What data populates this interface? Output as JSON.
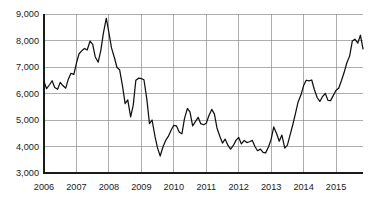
{
  "chart_data": {
    "type": "line",
    "title": "",
    "subtitle": "",
    "xlabel": "",
    "ylabel": "",
    "grid": true,
    "legend": false,
    "legend_position": "none",
    "line_color": "#111111",
    "grid_color": "#8c8c8c",
    "axis_color": "#1a1a1a",
    "background_color": "#ffffff",
    "xlim": [
      2006,
      2015.83
    ],
    "ylim": [
      3000,
      9000
    ],
    "y_ticks": [
      3000,
      4000,
      5000,
      6000,
      7000,
      8000,
      9000
    ],
    "y_tick_labels": [
      "3,000",
      "4,000",
      "5,000",
      "6,000",
      "7,000",
      "8,000",
      "9,000"
    ],
    "x_ticks": [
      2006,
      2007,
      2008,
      2009,
      2010,
      2011,
      2012,
      2013,
      2014,
      2015
    ],
    "x_tick_labels": [
      "2006",
      "2007",
      "2008",
      "2009",
      "2010",
      "2011",
      "2012",
      "2013",
      "2014",
      "2015"
    ],
    "series": [
      {
        "name": "index",
        "x": [
          2006.0,
          2006.08,
          2006.17,
          2006.25,
          2006.33,
          2006.42,
          2006.5,
          2006.58,
          2006.67,
          2006.75,
          2006.83,
          2006.92,
          2007.0,
          2007.08,
          2007.17,
          2007.25,
          2007.33,
          2007.42,
          2007.5,
          2007.58,
          2007.67,
          2007.75,
          2007.83,
          2007.92,
          2008.0,
          2008.08,
          2008.17,
          2008.25,
          2008.33,
          2008.42,
          2008.5,
          2008.58,
          2008.67,
          2008.75,
          2008.83,
          2008.92,
          2009.0,
          2009.08,
          2009.17,
          2009.25,
          2009.33,
          2009.42,
          2009.5,
          2009.58,
          2009.67,
          2009.75,
          2009.83,
          2009.92,
          2010.0,
          2010.08,
          2010.17,
          2010.25,
          2010.33,
          2010.42,
          2010.5,
          2010.58,
          2010.67,
          2010.75,
          2010.83,
          2010.92,
          2011.0,
          2011.08,
          2011.17,
          2011.25,
          2011.33,
          2011.42,
          2011.5,
          2011.58,
          2011.67,
          2011.75,
          2011.83,
          2011.92,
          2012.0,
          2012.08,
          2012.17,
          2012.25,
          2012.33,
          2012.42,
          2012.5,
          2012.58,
          2012.67,
          2012.75,
          2012.83,
          2012.92,
          2013.0,
          2013.08,
          2013.17,
          2013.25,
          2013.33,
          2013.42,
          2013.5,
          2013.58,
          2013.67,
          2013.75,
          2013.83,
          2013.92,
          2014.0,
          2014.08,
          2014.17,
          2014.25,
          2014.33,
          2014.42,
          2014.5,
          2014.58,
          2014.67,
          2014.75,
          2014.83,
          2014.92,
          2015.0,
          2015.08,
          2015.17,
          2015.25,
          2015.33,
          2015.42,
          2015.5,
          2015.58,
          2015.67,
          2015.75,
          2015.83
        ],
        "values": [
          6450,
          6180,
          6330,
          6480,
          6230,
          6160,
          6420,
          6300,
          6200,
          6540,
          6760,
          6720,
          7150,
          7500,
          7620,
          7700,
          7640,
          7980,
          7850,
          7380,
          7180,
          7620,
          8280,
          8840,
          8300,
          7720,
          7350,
          6980,
          6900,
          6280,
          5620,
          5760,
          5120,
          5560,
          6500,
          6580,
          6560,
          6520,
          5780,
          4860,
          5000,
          4380,
          3940,
          3640,
          4000,
          4230,
          4380,
          4620,
          4800,
          4780,
          4540,
          4480,
          5060,
          5440,
          5300,
          4780,
          4950,
          5100,
          4860,
          4820,
          4880,
          5160,
          5400,
          5230,
          4700,
          4380,
          4130,
          4280,
          4040,
          3900,
          4030,
          4240,
          4340,
          4100,
          4230,
          4150,
          4180,
          4230,
          4000,
          3840,
          3900,
          3780,
          3760,
          3990,
          4280,
          4740,
          4480,
          4200,
          4430,
          3940,
          4050,
          4420,
          4840,
          5250,
          5680,
          5950,
          6300,
          6500,
          6480,
          6510,
          6150,
          5840,
          5700,
          5880,
          6000,
          5740,
          5730,
          5940,
          6120,
          6200,
          6500,
          6800,
          7150,
          7420,
          7980,
          8050,
          7900,
          8200,
          7680
        ]
      }
    ],
    "annotations": []
  },
  "layout": {
    "plot_left": 44,
    "plot_right": 363,
    "plot_top": 14,
    "plot_bottom": 173
  }
}
